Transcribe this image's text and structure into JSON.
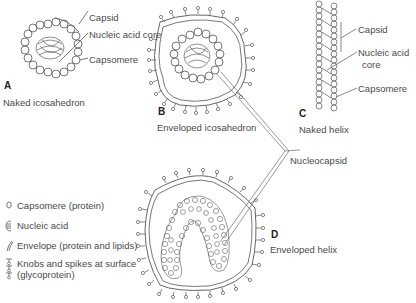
{
  "diagram": {
    "panels": [
      {
        "letter": "A",
        "caption": "Naked icosahedron",
        "labels": [
          "Capsid",
          "Nucleic acid core",
          "Capsomere"
        ]
      },
      {
        "letter": "B",
        "caption": "Enveloped icosahedron"
      },
      {
        "letter": "C",
        "caption": "Naked helix",
        "labels": [
          "Capsid",
          "Nucleic acid",
          "core",
          "Capsomere"
        ]
      },
      {
        "letter": "D",
        "caption": "Enveloped helix"
      }
    ],
    "shared_label": "Nucleocapsid",
    "legend": [
      {
        "icon": "capsomere-icon",
        "label": "Capsomere (protein)"
      },
      {
        "icon": "nucleic-acid-icon",
        "label": "Nucleic acid"
      },
      {
        "icon": "envelope-icon",
        "label": "Envelope (protein and lipids)"
      },
      {
        "icon": "spike-icon",
        "label": "Knobs and spikes at surface",
        "label2": "(glycoprotein)"
      }
    ],
    "colors": {
      "line": "#4a4a4a",
      "text": "#4a4a4a",
      "background": "#ffffff"
    }
  }
}
